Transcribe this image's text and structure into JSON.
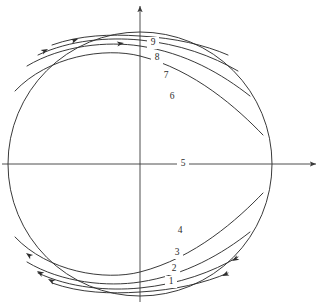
{
  "figure": {
    "background_color": "#ffffff",
    "line_color": "#2e2e2e",
    "axis_color": "#3a3a3a"
  },
  "geometry": {
    "center_x": 140,
    "center_y": 164,
    "radius": 132,
    "circle_label": "circular-boundary"
  },
  "axes": {
    "horizontal": {
      "name": "x-axis",
      "x1": 2,
      "y1": 164,
      "x2": 316,
      "y2": 164,
      "arrow": "right"
    },
    "vertical": {
      "name": "y-axis",
      "x1": 140,
      "y1": 302,
      "x2": 140,
      "y2": 6,
      "arrow": "up"
    }
  },
  "chart_data": {
    "type": "line",
    "xlabel": "",
    "ylabel": "",
    "grid": false,
    "legend": "none",
    "annotations": [
      "Nine labelled streamlines, numbered 1 through 9 from bottom to top",
      "Streamline 5 coincides with the horizontal axis",
      "Small arrowheads indicate the flow direction along the streamlines"
    ],
    "series": [
      {
        "name": "1",
        "label": "1",
        "label_x": 171,
        "label_y": 282,
        "path": "M 52 283 C 80 293 110 294 140 292 C 175 290 205 283 228 273",
        "arrows": [
          {
            "x": 222,
            "y": 276,
            "angle": 155
          }
        ]
      },
      {
        "name": "2",
        "label": "2",
        "label_x": 174,
        "label_y": 269,
        "path": "M 38 273 C 70 288 108 291 140 288 C 180 284 212 272 238 257",
        "arrows": [
          {
            "x": 48,
            "y": 279,
            "angle": 208
          },
          {
            "x": 232,
            "y": 261,
            "angle": 150
          }
        ]
      },
      {
        "name": "3",
        "label": "3",
        "label_x": 177,
        "label_y": 253,
        "path": "M 27 262 C 62 283 108 287 140 282 C 186 275 222 254 250 232",
        "arrows": [
          {
            "x": 37,
            "y": 271,
            "angle": 212
          }
        ]
      },
      {
        "name": "4",
        "label": "4",
        "label_x": 180,
        "label_y": 231,
        "path": "M 15 237 C 48 272 105 281 140 272 C 195 258 238 219 263 193",
        "arrows": [
          {
            "x": 26,
            "y": 253,
            "angle": 216
          }
        ]
      },
      {
        "name": "5",
        "label": "5",
        "label_x": 183,
        "label_y": 164,
        "path": "M 9 164 L 271 164",
        "arrows": []
      },
      {
        "name": "6",
        "label": "6",
        "label_x": 172,
        "label_y": 97,
        "path": "M 15 91 C 48 56 105 47 140 56 C 195 70 238 109 263 135",
        "arrows": []
      },
      {
        "name": "7",
        "label": "7",
        "label_x": 166,
        "label_y": 76,
        "path": "M 27 66 C 62 45 108 41 140 46 C 186 53 222 74 250 96",
        "arrows": []
      },
      {
        "name": "8",
        "label": "8",
        "label_x": 157,
        "label_y": 58,
        "path": "M 38 55 C 70 40 108 37 140 40 C 180 44 212 56 238 71",
        "arrows": [
          {
            "x": 48,
            "y": 49,
            "angle": 332
          }
        ]
      },
      {
        "name": "9",
        "label": "9",
        "label_x": 153,
        "label_y": 43,
        "path": "M 52 45 C 80 35 110 34 140 36 C 175 38 205 45 228 55",
        "arrows": [
          {
            "x": 78,
            "y": 39,
            "angle": 340
          },
          {
            "x": 124,
            "y": 43,
            "angle": 352
          }
        ]
      }
    ]
  }
}
